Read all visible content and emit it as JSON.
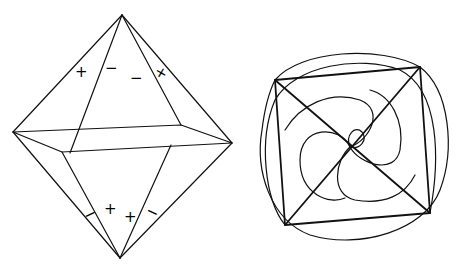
{
  "figure": {
    "left": {
      "name": "octahedron",
      "upper_signs": [
        "+",
        "−",
        "−",
        "+"
      ],
      "lower_signs": [
        "−",
        "+",
        "+",
        "−"
      ]
    },
    "right": {
      "name": "square-with-spiral-curves"
    }
  },
  "colors": {
    "stroke": "#111111",
    "background": "#ffffff"
  }
}
